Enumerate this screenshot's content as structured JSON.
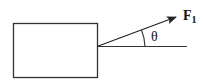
{
  "diagram": {
    "block": {
      "x": 13,
      "y": 23,
      "width": 84,
      "height": 54
    },
    "force": {
      "label": "F",
      "subscript": "1",
      "origin": [
        97,
        46
      ],
      "tip": [
        176,
        17
      ]
    },
    "reference_line": {
      "from": [
        97,
        46
      ],
      "to": [
        187,
        46
      ]
    },
    "angle": {
      "label": "θ",
      "arc_radius": 48
    },
    "colors": {
      "stroke": "#222222",
      "background": "#ffffff"
    }
  }
}
